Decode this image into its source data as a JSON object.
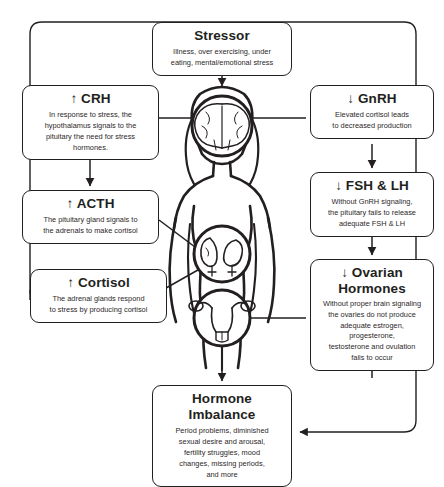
{
  "diagram": {
    "line_color": "#231f20",
    "background": "#ffffff"
  },
  "nodes": {
    "stressor": {
      "title": "Stressor",
      "body": "Illness, over exercising, under\neating, mental/emotional stress"
    },
    "crh": {
      "title": "↑ CRH",
      "body": "In response to stress, the\nhypothalamus signals to the\npituitary the need for stress\nhormones."
    },
    "acth": {
      "title": "↑ ACTH",
      "body": "The pituitary gland signals to\nthe adrenals to make cortisol"
    },
    "cortisol": {
      "title": "↑ Cortisol",
      "body": "The adrenal glands respond\nto stress by producing cortisol"
    },
    "gnrh": {
      "title": "↓ GnRH",
      "body": "Elevated cortisol leads\nto decreased production"
    },
    "fsh_lh": {
      "title": "↓ FSH & LH",
      "body": "Without GnRH signaling,\nthe pituitary fails to release\nadequate FSH & LH"
    },
    "ovarian": {
      "title": "↓ Ovarian\nHormones",
      "body": "Without proper brain signaling\nthe ovaries do not produce\nadequate estrogen, progesterone,\ntestosterone and ovulation\nfails to occur"
    },
    "imbalance": {
      "title": "Hormone Imbalance",
      "body": "Period problems, diminished\nsexual desire and arousal,\nfertility struggles, mood\nchanges, missing periods,\nand more"
    }
  },
  "figure": {
    "label": "female anatomical figure",
    "organs": [
      {
        "name": "brain",
        "label": "brain in head"
      },
      {
        "name": "adrenals",
        "label": "adrenal glands and kidneys"
      },
      {
        "name": "reproductive",
        "label": "uterus and ovaries"
      }
    ]
  }
}
